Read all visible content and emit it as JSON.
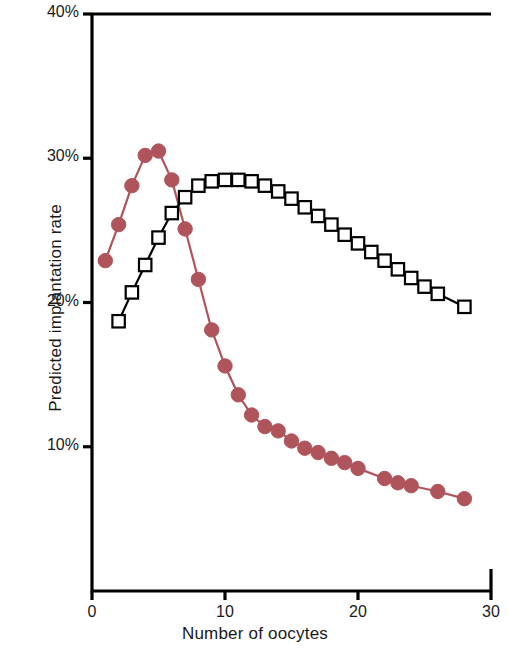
{
  "chart_data": {
    "type": "line",
    "title": "",
    "xlabel": "Number of oocytes",
    "ylabel": "Predicted implantation rate",
    "xlim": [
      0,
      30
    ],
    "ylim": [
      0,
      40
    ],
    "grid": false,
    "legend": "none",
    "x_ticks": [
      0,
      10,
      20,
      30
    ],
    "x_tick_labels": [
      "0",
      "10",
      "20",
      "30"
    ],
    "y_ticks": [
      10,
      20,
      30,
      40
    ],
    "y_tick_labels": [
      "10%",
      "20%",
      "30%",
      "40%"
    ],
    "series": [
      {
        "name": "filled-circle-series",
        "marker": "circle-filled",
        "color": "#b0545c",
        "line_color": "#b0545c",
        "x": [
          1,
          2,
          3,
          4,
          5,
          6,
          7,
          8,
          9,
          10,
          11,
          12,
          13,
          14,
          15,
          16,
          17,
          18,
          19,
          20,
          22,
          23,
          24,
          26,
          28
        ],
        "values": [
          22.9,
          25.4,
          28.1,
          30.2,
          30.5,
          28.5,
          25.1,
          21.6,
          18.1,
          15.6,
          13.6,
          12.2,
          11.4,
          11.1,
          10.4,
          9.9,
          9.6,
          9.2,
          8.9,
          8.5,
          7.8,
          7.5,
          7.3,
          6.9,
          6.4
        ]
      },
      {
        "name": "open-square-series",
        "marker": "square-open",
        "color": "#000000",
        "line_color": "#000000",
        "x": [
          2,
          3,
          4,
          5,
          6,
          7,
          8,
          9,
          10,
          11,
          12,
          13,
          14,
          15,
          16,
          17,
          18,
          19,
          20,
          21,
          22,
          23,
          24,
          25,
          26,
          28
        ],
        "values": [
          18.7,
          20.7,
          22.6,
          24.5,
          26.2,
          27.3,
          28.1,
          28.4,
          28.5,
          28.5,
          28.4,
          28.1,
          27.7,
          27.2,
          26.6,
          26.0,
          25.4,
          24.7,
          24.1,
          23.5,
          22.9,
          22.3,
          21.7,
          21.1,
          20.6,
          19.7
        ]
      }
    ]
  }
}
